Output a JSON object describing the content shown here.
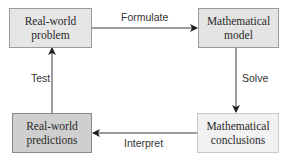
{
  "diagram": {
    "nodes": [
      {
        "id": "real-world-problem",
        "lines": [
          "Real-world",
          "problem"
        ],
        "fill": "#e6e6e6"
      },
      {
        "id": "mathematical-model",
        "lines": [
          "Mathematical",
          "model"
        ],
        "fill": "#e4e4e4"
      },
      {
        "id": "mathematical-conclusions",
        "lines": [
          "Mathematical",
          "conclusions"
        ],
        "fill": "#f1f1f1"
      },
      {
        "id": "real-world-predictions",
        "lines": [
          "Real-world",
          "predictions"
        ],
        "fill": "#cfcfcf"
      }
    ],
    "edges": [
      {
        "from": "real-world-problem",
        "to": "mathematical-model",
        "label": "Formulate"
      },
      {
        "from": "mathematical-model",
        "to": "mathematical-conclusions",
        "label": "Solve"
      },
      {
        "from": "mathematical-conclusions",
        "to": "real-world-predictions",
        "label": "Interpret"
      },
      {
        "from": "real-world-predictions",
        "to": "real-world-problem",
        "label": "Test"
      }
    ],
    "colors": {
      "line": "#3a3a3a",
      "border": "#9a9a9a",
      "text": "#2a2a2a"
    }
  }
}
